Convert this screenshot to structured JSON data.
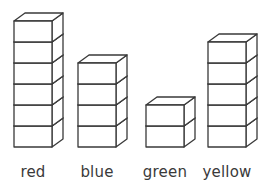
{
  "chart_data": {
    "type": "bar",
    "title": "",
    "subtitle": "",
    "xlabel": "",
    "ylabel": "",
    "categories": [
      "red",
      "blue",
      "green",
      "yellow"
    ],
    "values": [
      6,
      4,
      2,
      5
    ],
    "unit": "cubes",
    "ylim": [
      0,
      6
    ],
    "grid": false,
    "legend": null,
    "annotations": [],
    "style": {
      "render": "isometric-cube-stack",
      "fill_color": "#ffffff",
      "stroke_color": "#3a3a3a",
      "background_color": "#ffffff",
      "label_color": "#3a3a3a"
    }
  },
  "geometry": {
    "cube_width": 38,
    "cube_height": 21,
    "depth_x": 11,
    "depth_y": 8,
    "baseline_y": 147,
    "bar_left_x": [
      14,
      78,
      146,
      208
    ]
  },
  "labels": {
    "red": "red",
    "blue": "blue",
    "green": "green",
    "yellow": "yellow"
  },
  "label_centers": [
    33,
    97,
    165,
    227
  ]
}
